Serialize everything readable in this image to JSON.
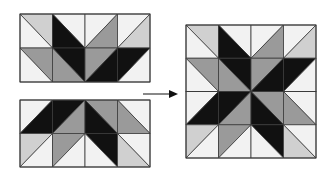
{
  "colors": {
    "white": "#f2f2f2",
    "light": "#d0d0d0",
    "mid": "#9a9a9a",
    "dark": "#111111",
    "line": "#3a3a3a"
  },
  "figure": {
    "arrow": "right-arrow"
  },
  "blocks": {
    "top_half": {
      "rows": 2,
      "cols": 4,
      "cells": [
        [
          {
            "diag": "tl-br",
            "a": "light",
            "b": "white"
          },
          {
            "diag": "tl-br",
            "a": "white",
            "b": "dark"
          },
          {
            "diag": "bl-tr",
            "a": "white",
            "b": "mid"
          },
          {
            "diag": "bl-tr",
            "a": "white",
            "b": "light"
          }
        ],
        [
          {
            "diag": "tl-br",
            "a": "mid",
            "b": "white"
          },
          {
            "diag": "tl-br",
            "a": "dark",
            "b": "mid"
          },
          {
            "diag": "bl-tr",
            "a": "mid",
            "b": "dark"
          },
          {
            "diag": "bl-tr",
            "a": "dark",
            "b": "white"
          }
        ]
      ]
    },
    "bottom_half": {
      "rows": 2,
      "cols": 4,
      "cells": [
        [
          {
            "diag": "bl-tr",
            "a": "white",
            "b": "dark"
          },
          {
            "diag": "bl-tr",
            "a": "dark",
            "b": "mid"
          },
          {
            "diag": "tl-br",
            "a": "mid",
            "b": "dark"
          },
          {
            "diag": "tl-br",
            "a": "white",
            "b": "mid"
          }
        ],
        [
          {
            "diag": "bl-tr",
            "a": "light",
            "b": "white"
          },
          {
            "diag": "bl-tr",
            "a": "mid",
            "b": "white"
          },
          {
            "diag": "tl-br",
            "a": "dark",
            "b": "white"
          },
          {
            "diag": "tl-br",
            "a": "white",
            "b": "light"
          }
        ]
      ]
    }
  }
}
